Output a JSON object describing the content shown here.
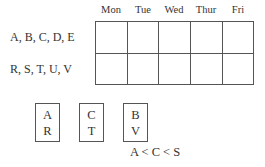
{
  "schedule": {
    "days": [
      "Mon",
      "Tue",
      "Wed",
      "Thur",
      "Fri"
    ],
    "rows": [
      {
        "label": "A, B, C, D, E",
        "cells": [
          "",
          "",
          "",
          "",
          ""
        ]
      },
      {
        "label": "R, S, T, U, V",
        "cells": [
          "",
          "",
          "",
          "",
          ""
        ]
      }
    ]
  },
  "pairs": [
    {
      "top": "A",
      "bottom": "R"
    },
    {
      "top": "C",
      "bottom": "T"
    },
    {
      "top": "B",
      "bottom": "V"
    }
  ],
  "constraint": "A < C < S"
}
